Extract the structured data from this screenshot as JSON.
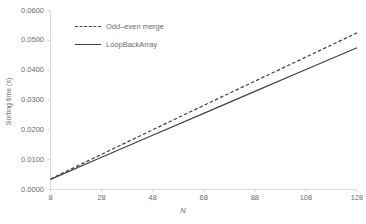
{
  "chart_data": {
    "type": "line",
    "title": "",
    "xlabel": "N",
    "ylabel": "Sorting time (s)",
    "xlim": [
      8,
      128
    ],
    "ylim": [
      0.0,
      0.06
    ],
    "grid": false,
    "legend_position": "top-center",
    "x_ticks": [
      "8",
      "28",
      "48",
      "68",
      "88",
      "108",
      "128"
    ],
    "x_tick_values": [
      8,
      28,
      48,
      68,
      88,
      108,
      128
    ],
    "y_ticks": [
      "0.0000",
      "0.0100",
      "0.0200",
      "0.0300",
      "0.0400",
      "0.0500",
      "0.0600"
    ],
    "y_tick_values": [
      0.0,
      0.01,
      0.02,
      0.03,
      0.04,
      0.05,
      0.06
    ],
    "x": [
      8,
      28,
      48,
      68,
      88,
      108,
      128
    ],
    "series": [
      {
        "name": "Odd–even merge",
        "style": "dashed",
        "color": "#404040",
        "values": [
          0.0035,
          0.0118,
          0.02,
          0.0282,
          0.0363,
          0.0444,
          0.0525
        ]
      },
      {
        "name": "LoopBackArray",
        "style": "solid",
        "color": "#404040",
        "values": [
          0.0034,
          0.0108,
          0.0182,
          0.0255,
          0.0329,
          0.0402,
          0.0475
        ]
      }
    ]
  },
  "axes": {
    "y_axis_title": "Sorting time (s)",
    "x_axis_title": "N"
  },
  "legend": {
    "items": [
      {
        "label": "Odd–even merge",
        "style": "dashed"
      },
      {
        "label": "LoopBackArray",
        "style": "solid"
      }
    ]
  },
  "colors": {
    "line": "#404040",
    "axis": "#d9d9d9",
    "text": "#6b6b6b",
    "background": "#ffffff"
  }
}
